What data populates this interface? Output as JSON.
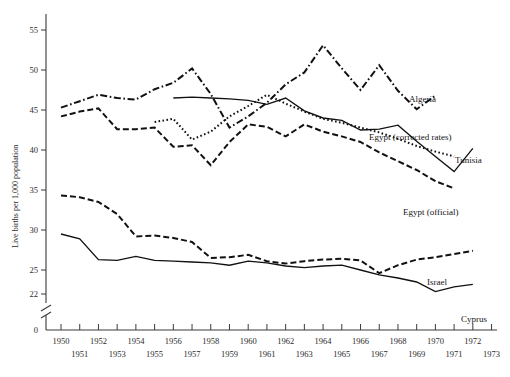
{
  "chart_data": {
    "type": "line",
    "title": "",
    "xlabel": "",
    "ylabel": "Live births per 1,000 population",
    "xlim": [
      1949.3,
      1973.6
    ],
    "ylim": [
      21.2,
      56.6
    ],
    "grid": false,
    "legend_position": "right-inline-labels",
    "y_ticks": [
      22,
      25,
      30,
      35,
      40,
      45,
      50,
      55
    ],
    "y_axis_break": true,
    "y_axis_zero_label": "0",
    "x_ticks": [
      1950,
      1951,
      1952,
      1953,
      1954,
      1955,
      1956,
      1957,
      1958,
      1959,
      1960,
      1961,
      1962,
      1963,
      1964,
      1965,
      1966,
      1967,
      1968,
      1969,
      1970,
      1971,
      1972,
      1973
    ],
    "x_tick_labels_upper": [
      "1950",
      "1952",
      "1954",
      "1956",
      "1958",
      "1960",
      "1962",
      "1964",
      "1966",
      "1968",
      "1970",
      "1972"
    ],
    "x_tick_labels_lower": [
      "1951",
      "1953",
      "1955",
      "1957",
      "1959",
      "1961",
      "1963",
      "1965",
      "1967",
      "1969",
      "1971",
      "1973"
    ],
    "series": [
      {
        "name": "Algeria",
        "label": "Algeria",
        "style": "dash-dot",
        "x": [
          1950,
          1951,
          1952,
          1953,
          1954,
          1955,
          1956,
          1957,
          1958,
          1959,
          1960,
          1961,
          1962,
          1963,
          1964,
          1965,
          1966,
          1967,
          1968,
          1969,
          1970
        ],
        "values": [
          45.3,
          46.1,
          46.9,
          46.5,
          46.3,
          47.6,
          48.4,
          50.2,
          47.0,
          42.8,
          44.2,
          45.9,
          48.2,
          49.7,
          53.1,
          50.2,
          47.5,
          50.6,
          47.4,
          45.1,
          46.8
        ]
      },
      {
        "name": "Egypt (corrected rates)",
        "label": "Egypt (corrected rates)",
        "style": "dotted",
        "x": [
          1955,
          1956,
          1957,
          1958,
          1959,
          1960,
          1961,
          1962,
          1963,
          1964,
          1965,
          1966,
          1967,
          1968,
          1969,
          1970,
          1971
        ],
        "values": [
          43.5,
          43.9,
          41.3,
          42.3,
          44.2,
          45.5,
          46.9,
          45.8,
          44.8,
          43.9,
          43.4,
          42.8,
          42.2,
          41.4,
          40.5,
          39.8,
          39.2
        ]
      },
      {
        "name": "Tunisia",
        "label": "Tunisia",
        "style": "solid",
        "x": [
          1956,
          1957,
          1958,
          1959,
          1960,
          1961,
          1962,
          1963,
          1964,
          1965,
          1966,
          1967,
          1968,
          1969,
          1970,
          1971,
          1972
        ],
        "values": [
          46.5,
          46.6,
          46.5,
          46.4,
          46.2,
          45.7,
          46.5,
          44.9,
          44.0,
          43.7,
          42.5,
          42.6,
          43.1,
          41.1,
          39.2,
          37.3,
          40.2
        ]
      },
      {
        "name": "Egypt (official)",
        "label": "Egypt (official)",
        "style": "long-dash",
        "x": [
          1950,
          1951,
          1952,
          1953,
          1954,
          1955,
          1956,
          1957,
          1958,
          1959,
          1960,
          1961,
          1962,
          1963,
          1964,
          1965,
          1966,
          1967,
          1968,
          1969,
          1970,
          1971
        ],
        "values": [
          44.2,
          44.8,
          45.2,
          42.6,
          42.6,
          42.8,
          40.4,
          40.6,
          38.1,
          41.0,
          43.2,
          42.9,
          41.7,
          43.2,
          42.3,
          41.7,
          41.0,
          39.7,
          38.6,
          37.5,
          36.1,
          35.2
        ]
      },
      {
        "name": "Israel",
        "label": "Israel",
        "style": "long-dash",
        "x": [
          1950,
          1951,
          1952,
          1953,
          1954,
          1955,
          1956,
          1957,
          1958,
          1959,
          1960,
          1961,
          1962,
          1963,
          1964,
          1965,
          1966,
          1967,
          1968,
          1969,
          1970,
          1971,
          1972
        ],
        "values": [
          34.3,
          34.1,
          33.5,
          32.0,
          29.2,
          29.3,
          29.0,
          28.5,
          26.5,
          26.6,
          26.9,
          26.1,
          25.8,
          26.1,
          26.3,
          26.4,
          26.2,
          24.6,
          25.6,
          26.3,
          26.6,
          27.0,
          27.4
        ]
      },
      {
        "name": "Cyprus",
        "label": "Cyprus",
        "style": "solid",
        "x": [
          1950,
          1951,
          1952,
          1953,
          1954,
          1955,
          1956,
          1957,
          1958,
          1959,
          1960,
          1961,
          1962,
          1963,
          1964,
          1965,
          1966,
          1967,
          1968,
          1969,
          1970,
          1971,
          1972
        ],
        "values": [
          29.5,
          28.9,
          26.3,
          26.2,
          26.7,
          26.2,
          26.1,
          26.0,
          25.9,
          25.6,
          26.1,
          25.9,
          25.5,
          25.3,
          25.5,
          25.6,
          25.0,
          24.4,
          24.0,
          23.5,
          22.3,
          22.9,
          23.2
        ]
      }
    ]
  },
  "axis": {
    "y_title": "Live births per 1,000 population",
    "tick_22": "22",
    "tick_25": "25",
    "tick_30": "30",
    "tick_35": "35",
    "tick_40": "40",
    "tick_45": "45",
    "tick_50": "50",
    "tick_55": "55",
    "tick_0": "0"
  },
  "x_labels": {
    "y1950": "1950",
    "y1951": "1951",
    "y1952": "1952",
    "y1953": "1953",
    "y1954": "1954",
    "y1955": "1955",
    "y1956": "1956",
    "y1957": "1957",
    "y1958": "1958",
    "y1959": "1959",
    "y1960": "1960",
    "y1961": "1961",
    "y1962": "1962",
    "y1963": "1963",
    "y1964": "1964",
    "y1965": "1965",
    "y1966": "1966",
    "y1967": "1967",
    "y1968": "1968",
    "y1969": "1969",
    "y1970": "1970",
    "y1971": "1971",
    "y1972": "1972",
    "y1973": "1973"
  },
  "series_labels": {
    "algeria": "Algeria",
    "egypt_corrected": "Egypt (corrected rates)",
    "tunisia": "Tunisia",
    "egypt_official": "Egypt (official)",
    "israel": "Israel",
    "cyprus": "Cyprus"
  }
}
